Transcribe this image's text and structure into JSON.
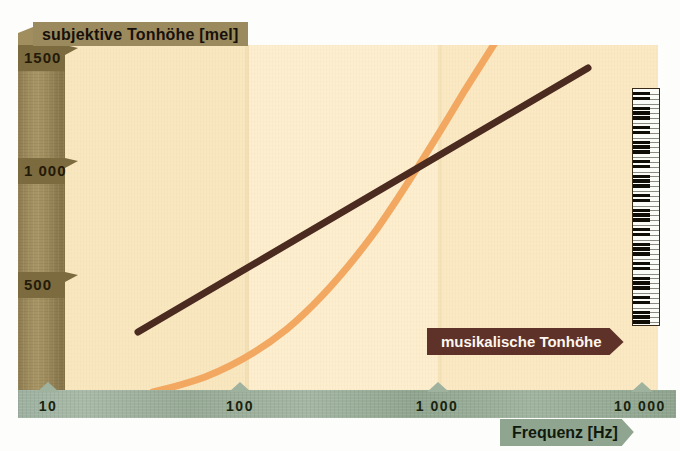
{
  "chart_data": {
    "type": "line",
    "title": "",
    "xlabel": "Frequenz [Hz]",
    "ylabel": "subjektive Tonhöhe [mel]",
    "x_scale": "log",
    "xlim": [
      10,
      10000
    ],
    "ylim": [
      0,
      1600
    ],
    "x_ticks": [
      "10",
      "100",
      "1 000",
      "10 000"
    ],
    "x_tick_values": [
      10,
      100,
      1000,
      10000
    ],
    "y_ticks": [
      "500",
      "1 000",
      "1500"
    ],
    "y_tick_values": [
      500,
      1000,
      1500
    ],
    "grid": false,
    "legend": "inline-annotation",
    "series": [
      {
        "name": "subjektive Tonhöhe (mel-Skala)",
        "color": "#f2a860",
        "style": "curve",
        "x": [
          20,
          30,
          50,
          80,
          100,
          150,
          200,
          300,
          500,
          800,
          1000,
          1500,
          2000,
          2600
        ],
        "y": [
          10,
          25,
          55,
          95,
          120,
          180,
          240,
          350,
          520,
          720,
          830,
          1060,
          1250,
          1550
        ]
      },
      {
        "name": "musikalische Tonhöhe",
        "color": "#4b2b20",
        "style": "straight-line",
        "x": [
          27,
          4200
        ],
        "y": [
          330,
          1480
        ]
      }
    ],
    "annotations": [
      {
        "text": "musikalische Tonhöhe",
        "color": "#5e3228",
        "text_color": "#fdf6ee"
      }
    ],
    "decorations": [
      {
        "name": "piano-keyboard",
        "orientation": "vertical",
        "octaves": 7
      }
    ],
    "background_bands": [
      "#f9e7c0",
      "#fdeecf",
      "#fbe9c4"
    ]
  },
  "axes": {
    "y": {
      "title": "subjektive Tonhöhe [mel]",
      "ticks": [
        {
          "label": "1500",
          "top": 45
        },
        {
          "label": "1 000",
          "top": 158
        },
        {
          "label": "500",
          "top": 272
        }
      ]
    },
    "x": {
      "title": "Frequenz [Hz]",
      "ticks": [
        {
          "label": "10",
          "left": 30,
          "notch": 47
        },
        {
          "label": "100",
          "left": 222,
          "notch": 239
        },
        {
          "label": "1 000",
          "left": 410,
          "notch": 437
        },
        {
          "label": "10 000",
          "left": 610,
          "notch": 641
        }
      ]
    }
  },
  "labels": {
    "musical_pitch": "musikalische Tonhöhe"
  },
  "colors": {
    "subjective_curve": "#f2a860",
    "musical_line": "#4b2b20",
    "y_axis_bar": "#9c8a5c",
    "x_axis_bar": "#9db0a0",
    "plot_background": "#fbebc8",
    "banner_musical": "#5e3228"
  }
}
